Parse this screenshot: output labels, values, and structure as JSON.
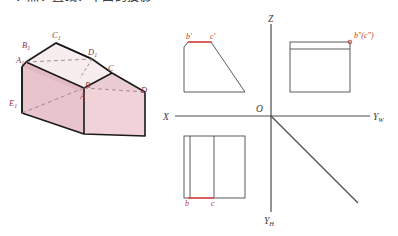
{
  "page": {
    "header_text": "一、点、直线、平面的投影"
  },
  "solid": {
    "name": "pictorial-solid",
    "fill_color": "#e8c4cc",
    "fill_color_light": "#f3e2e6",
    "edge_color": "#1a1a1a",
    "label_color": "#8c3b46",
    "vertices": [
      {
        "id": "A1",
        "base": "A",
        "sub": "1",
        "x": 16,
        "y": 63
      },
      {
        "id": "B1",
        "base": "B",
        "sub": "1",
        "x": 22,
        "y": 48
      },
      {
        "id": "C1",
        "base": "C",
        "sub": "1",
        "x": 52,
        "y": 38
      },
      {
        "id": "D1",
        "base": "D",
        "sub": "1",
        "x": 88,
        "y": 55
      },
      {
        "id": "E1",
        "base": "E",
        "sub": "1",
        "x": 9,
        "y": 106
      },
      {
        "id": "A",
        "base": "A",
        "sub": "",
        "x": 80,
        "y": 95
      },
      {
        "id": "B",
        "base": "B",
        "sub": "",
        "x": 85,
        "y": 85
      },
      {
        "id": "C",
        "base": "C",
        "sub": "",
        "x": 108,
        "y": 71
      },
      {
        "id": "D",
        "base": "D",
        "sub": "",
        "x": 141,
        "y": 90
      }
    ]
  },
  "projection": {
    "name": "orthographic-projection-chart",
    "axes": [
      {
        "id": "Z",
        "label": "Z",
        "sub": "",
        "x": 272,
        "y": 22
      },
      {
        "id": "X",
        "label": "X",
        "sub": "",
        "x": 166,
        "y": 121
      },
      {
        "id": "YW",
        "label": "Y",
        "sub": "W",
        "x": 374,
        "y": 121
      },
      {
        "id": "YH",
        "label": "Y",
        "sub": "H",
        "x": 258,
        "y": 222
      },
      {
        "id": "O",
        "label": "O",
        "sub": "",
        "x": 256,
        "y": 108
      }
    ],
    "views": {
      "front": {
        "name": "front-view-trapezoid",
        "labels": [
          {
            "text": "b'",
            "x": 188,
            "y": 37
          },
          {
            "text": "c'",
            "x": 213,
            "y": 37
          }
        ],
        "highlight_color": "#e8423a"
      },
      "side": {
        "name": "side-view-rectangle",
        "labels": [
          {
            "text": "b\"(c\")",
            "x": 356,
            "y": 35
          }
        ],
        "marker_color": "#c0392b"
      },
      "top": {
        "name": "top-view-rectangle",
        "labels": [
          {
            "text": "b",
            "x": 185,
            "y": 203
          },
          {
            "text": "c",
            "x": 211,
            "y": 203
          }
        ],
        "highlight_color": "#e8423a"
      }
    },
    "line_color": "#4a4a4a"
  }
}
